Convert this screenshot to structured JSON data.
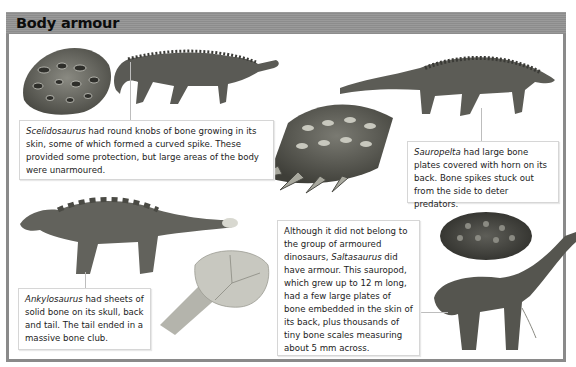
{
  "header": {
    "title": "Body armour"
  },
  "captions": {
    "scelidosaurus": {
      "species": "Scelidosaurus",
      "text": " had round knobs of bone growing in its skin, some of which formed a curved spike. These provided some protection, but large areas of the body were unarmoured."
    },
    "sauropelta": {
      "species": "Sauropelta",
      "text": " had large bone plates covered with horn on its back. Bone spikes stuck out from the side to deter predators."
    },
    "ankylosaurus": {
      "species": "Ankylosaurus",
      "text": " had sheets of solid bone on its skull, back and tail. The tail ended in a massive bone club."
    },
    "saltasaurus": {
      "pre": "Although it did not belong to the group of armoured dinosaurs, ",
      "species": "Saltasaurus",
      "text": " did have armour. This sauropod, which grew up to 12 m long, had a few large plates of bone embedded in the skin of its back, plus thousands of tiny bone scales measuring about 5 mm across."
    }
  },
  "illustrations": [
    {
      "name": "scelidosaurus-skin-knobs"
    },
    {
      "name": "scelidosaurus-body"
    },
    {
      "name": "sauropelta-body"
    },
    {
      "name": "sauropelta-spiked-plates"
    },
    {
      "name": "ankylosaurus-body"
    },
    {
      "name": "ankylosaurus-tail-club"
    },
    {
      "name": "saltasaurus-skin-plate"
    },
    {
      "name": "saltasaurus-body"
    }
  ],
  "colors": {
    "header": "#929292",
    "border": "#8a8a8a",
    "title": "#0c0c0c"
  }
}
